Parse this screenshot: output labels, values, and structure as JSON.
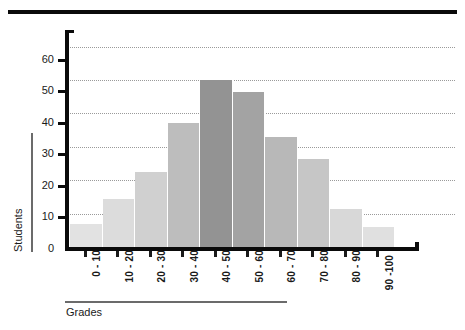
{
  "chart_data": {
    "type": "bar",
    "title": "",
    "subtitle": "",
    "xlabel": "Grades",
    "ylabel": "Students",
    "categories": [
      "0 - 10",
      "10 - 20",
      "20 - 30",
      "30 - 40",
      "40 - 50",
      "50 - 60",
      "60 - 70",
      "70 - 80",
      "80 - 90",
      "90 -100"
    ],
    "values": [
      7,
      14.5,
      22.5,
      37,
      50,
      46.5,
      33,
      26.5,
      11.5,
      6
    ],
    "series": [
      {
        "name": "Students",
        "values": [
          7,
          14.5,
          22.5,
          37,
          50,
          46.5,
          33,
          26.5,
          11.5,
          6
        ]
      }
    ],
    "bar_colors": [
      "#e2e2e2",
      "#dcdcdc",
      "#d0d0d0",
      "#bdbdbd",
      "#939393",
      "#a3a3a3",
      "#b8b8b8",
      "#c6c6c6",
      "#d8d8d8",
      "#e0e0e0"
    ],
    "ylim": [
      0,
      65
    ],
    "xlim": [
      0,
      10
    ],
    "y_ticks": [
      "0",
      "10",
      "20",
      "30",
      "40",
      "50",
      "60"
    ],
    "y_tick_values": [
      0,
      10,
      20,
      30,
      40,
      50,
      60
    ],
    "gridlines": [
      10,
      20,
      30,
      40,
      50,
      60
    ],
    "grid": true,
    "grid_style": "dotted",
    "legend": false,
    "legend_position": "none",
    "annotations": []
  },
  "axes": {
    "y_title": "Students",
    "x_title": "Grades"
  },
  "colors": {
    "axis": "#0a0a0a",
    "grid": "#9a9a9a",
    "text": "#1a1a1a",
    "rule": "#6b6b6b",
    "background": "#ffffff"
  }
}
